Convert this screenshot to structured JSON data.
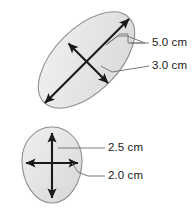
{
  "figure": {
    "background_color": "#ffffff",
    "shape_fill_color": "#e3e3e3",
    "shape_fill_highlight": "#f0f0f0",
    "shape_stroke_color": "#8a8a8a",
    "arrow_color": "#1a1a1a",
    "leader_color": "#6e6e6e",
    "text_color": "#1a1a1a"
  },
  "shapes": [
    {
      "id": "ellipse-top",
      "name": "tilted-ellipse",
      "dimensions": [
        {
          "id": "major-axis",
          "label": "5.0 cm",
          "value": 5.0,
          "unit": "cm"
        },
        {
          "id": "minor-axis",
          "label": "3.0 cm",
          "value": 3.0,
          "unit": "cm"
        }
      ]
    },
    {
      "id": "oval-bottom",
      "name": "egg-oval",
      "dimensions": [
        {
          "id": "vertical-axis",
          "label": "2.5 cm",
          "value": 2.5,
          "unit": "cm"
        },
        {
          "id": "horizontal-axis",
          "label": "2.0 cm",
          "value": 2.0,
          "unit": "cm"
        }
      ]
    }
  ],
  "labels": {
    "top_major": "5.0 cm",
    "top_minor": "3.0 cm",
    "bottom_vertical": "2.5 cm",
    "bottom_horizontal": "2.0 cm"
  }
}
